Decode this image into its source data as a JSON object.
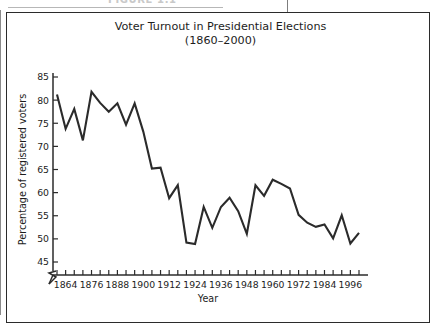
{
  "running_head": {
    "text": "FIGURE 1.1",
    "visible_note": "cropped at top edge"
  },
  "figure": {
    "title_line1": "Voter Turnout in Presidential Elections",
    "title_line2": "(1860–2000)"
  },
  "chart_data": {
    "type": "line",
    "title": "Voter Turnout in Presidential Elections (1860–2000)",
    "xlabel": "Year",
    "ylabel": "Percentage of registered voters",
    "xlim": [
      1860,
      2000
    ],
    "ylim": [
      45,
      85
    ],
    "y_axis_break": true,
    "y_break_note": "axis broken below 45",
    "grid": false,
    "legend": false,
    "yticks": [
      45,
      50,
      55,
      60,
      65,
      70,
      75,
      80,
      85
    ],
    "ytick_labels": [
      "45",
      "50",
      "55",
      "60",
      "65",
      "70",
      "75",
      "80",
      "85"
    ],
    "xticks": [
      1860,
      1864,
      1868,
      1872,
      1876,
      1880,
      1884,
      1888,
      1892,
      1896,
      1900,
      1904,
      1908,
      1912,
      1916,
      1920,
      1924,
      1928,
      1932,
      1936,
      1940,
      1944,
      1948,
      1952,
      1956,
      1960,
      1964,
      1968,
      1972,
      1976,
      1980,
      1984,
      1988,
      1992,
      1996,
      2000
    ],
    "xtick_labels": [
      "1864",
      "1876",
      "1888",
      "1900",
      "1912",
      "1924",
      "1936",
      "1948",
      "1960",
      "1972",
      "1984",
      "1996"
    ],
    "xtick_labeled_years": [
      1864,
      1876,
      1888,
      1900,
      1912,
      1924,
      1936,
      1948,
      1960,
      1972,
      1984,
      1996
    ],
    "x": [
      1860,
      1864,
      1868,
      1872,
      1876,
      1880,
      1884,
      1888,
      1892,
      1896,
      1900,
      1904,
      1908,
      1912,
      1916,
      1920,
      1924,
      1928,
      1932,
      1936,
      1940,
      1944,
      1948,
      1952,
      1956,
      1960,
      1964,
      1968,
      1972,
      1976,
      1980,
      1984,
      1988,
      1992,
      1996,
      2000
    ],
    "values": [
      81.2,
      73.8,
      78.1,
      71.3,
      81.8,
      79.4,
      77.5,
      79.3,
      74.7,
      79.3,
      73.2,
      65.2,
      65.4,
      58.8,
      61.6,
      49.2,
      48.9,
      56.9,
      52.4,
      56.9,
      58.9,
      56.0,
      51.1,
      61.6,
      59.3,
      62.8,
      61.9,
      60.9,
      55.2,
      53.5,
      52.6,
      53.1,
      50.1,
      55.1,
      49.0,
      51.3
    ],
    "series_name": "Voter turnout",
    "line_color": "#2b2b2b"
  }
}
